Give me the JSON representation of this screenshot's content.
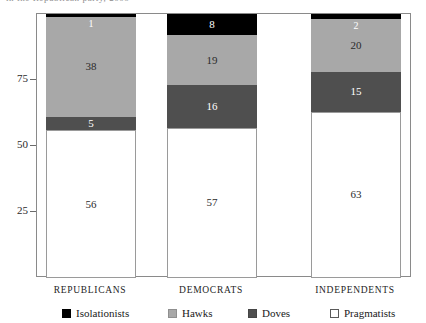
{
  "caption_sliver": "in the Republican party, 2009",
  "chart_data": {
    "type": "bar",
    "title": "",
    "subtitle": "",
    "xlabel": "",
    "ylabel": "",
    "stacked": true,
    "stack_order_bottom_to_top": [
      "Pragmatists",
      "Doves",
      "Hawks",
      "Isolationists"
    ],
    "categories": [
      "Republicans",
      "Democrats",
      "Independents"
    ],
    "category_labels": [
      "REPUBLICANS",
      "DEMOCRATS",
      "INDEPENDENTS"
    ],
    "series": [
      {
        "name": "Isolationists",
        "color": "#000000",
        "values": [
          1,
          8,
          2
        ]
      },
      {
        "name": "Hawks",
        "color": "#a8a8a8",
        "values": [
          38,
          19,
          20
        ]
      },
      {
        "name": "Doves",
        "color": "#4f4f4f",
        "values": [
          5,
          16,
          15
        ]
      },
      {
        "name": "Pragmatists",
        "color": "#ffffff",
        "values": [
          56,
          57,
          63
        ]
      }
    ],
    "ylim": [
      0,
      100
    ],
    "yticks": [
      25,
      50,
      75
    ],
    "ytick_labels": [
      "25",
      "50",
      "75"
    ],
    "grid": false,
    "legend_position": "bottom",
    "legend": [
      {
        "label": "Isolationists",
        "color": "#000000"
      },
      {
        "label": "Hawks",
        "color": "#a8a8a8"
      },
      {
        "label": "Doves",
        "color": "#4f4f4f"
      },
      {
        "label": "Pragmatists",
        "color": "#ffffff"
      }
    ],
    "bar_values_rendered": {
      "Republicans": {
        "Isolationists": "1",
        "Hawks": "38",
        "Doves": "5",
        "Pragmatists": "56"
      },
      "Democrats": {
        "Isolationists": "8",
        "Hawks": "19",
        "Doves": "16",
        "Pragmatists": "57"
      },
      "Independents": {
        "Isolationists": "2",
        "Hawks": "20",
        "Doves": "15",
        "Pragmatists": "63"
      }
    }
  }
}
